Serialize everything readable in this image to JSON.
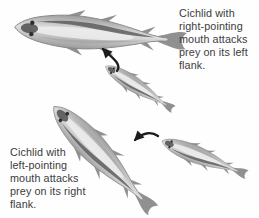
{
  "page": {
    "background": "#fefefe",
    "kind": "biology-figure"
  },
  "captions": {
    "top": {
      "full_text": "Cichlid with right-pointing mouth attacks prey on its left flank.",
      "lines": [
        "Cichlid with",
        "right-pointing",
        "mouth attacks",
        "prey on its left",
        "flank."
      ]
    },
    "bottom": {
      "full_text": "Cichlid with left-pointing mouth attacks prey on its right flank.",
      "lines": [
        "Cichlid with",
        "left-pointing",
        "mouth attacks",
        "prey on its right",
        "flank."
      ]
    }
  },
  "colors": {
    "text": "#3c3c3c",
    "arrow": "#1c1c1c",
    "fish_body_edge": "#989898",
    "fish_body_light": "#dfdfdf",
    "fish_outline": "#888888",
    "fish_fin": "#909090",
    "fish_highlight": "#ebebeb",
    "fish_stripe_dark": "#5e5e5e",
    "fish_stripe_light": "#a6a6a6",
    "fish_head": "#454545",
    "fish_eye": "#2e2e2e"
  }
}
